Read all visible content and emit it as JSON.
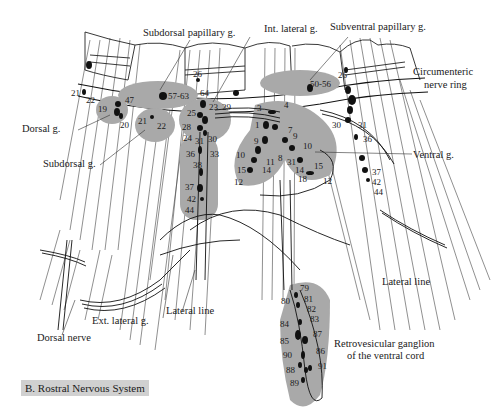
{
  "figure": {
    "caption": "B. Rostral Nervous System"
  },
  "labels": {
    "subdorsal_papillary_g": "Subdorsal papillary g.",
    "int_lateral_g": "Int. lateral g.",
    "subventral_papillary_g": "Subventral papillary g.",
    "circumenteric_nerve_ring_line1": "Circumenteric",
    "circumenteric_nerve_ring_line2": "nerve ring",
    "dorsal_g": "Dorsal g.",
    "subdorsal_g": "Subdorsal g.",
    "ventral_g": "Ventral g.",
    "lateral_line_right": "Lateral line",
    "lateral_line_center": "Lateral line",
    "ext_lateral_g": "Ext. lateral g.",
    "dorsal_nerve": "Dorsal nerve",
    "retrovesicular_line1": "Retrovesicular ganglion",
    "retrovesicular_line2": "of the ventral cord"
  },
  "neuron_numbers": {
    "n21a": "21",
    "n22a": "22",
    "n47": "47",
    "n19": "19",
    "n20": "20",
    "n21b": "21",
    "n22b": "22",
    "n57_63": "57-63",
    "n26a": "26",
    "n64": "64",
    "n23": "23",
    "n29": "29",
    "n25": "25",
    "n28": "28",
    "n24": "24",
    "n31a": "31",
    "n30a": "30",
    "n36a": "36",
    "n33": "33",
    "n38": "38",
    "n37a": "37",
    "n42a": "42",
    "n44a": "44",
    "n3": "3",
    "n4": "4",
    "n1": "1",
    "n7": "7",
    "n9a": "9",
    "n9b": "9",
    "n10a": "10",
    "n10b": "10",
    "n11": "11",
    "n8": "8",
    "n31b": "31",
    "n14a": "14",
    "n14b": "14",
    "n15a": "15",
    "n15b": "15",
    "n18": "18",
    "n12a": "12",
    "n12b": "12",
    "n50_56": "50-56",
    "n26b": "26",
    "n30b": "30",
    "n31c": "31",
    "n36b": "36",
    "n37b": "37",
    "n42b": "42",
    "n44b": "44",
    "n79": "79",
    "n80": "80",
    "n81": "81",
    "n82": "82",
    "n83": "83",
    "n84": "84",
    "n87": "87",
    "n85": "85",
    "n86": "86",
    "n90": "90",
    "n91": "91",
    "n88": "88",
    "n89": "89"
  },
  "colors": {
    "ganglion_shade": "#a9a9a9",
    "ink": "#1a1a1a",
    "caption_bg": "#d0d0d0"
  }
}
